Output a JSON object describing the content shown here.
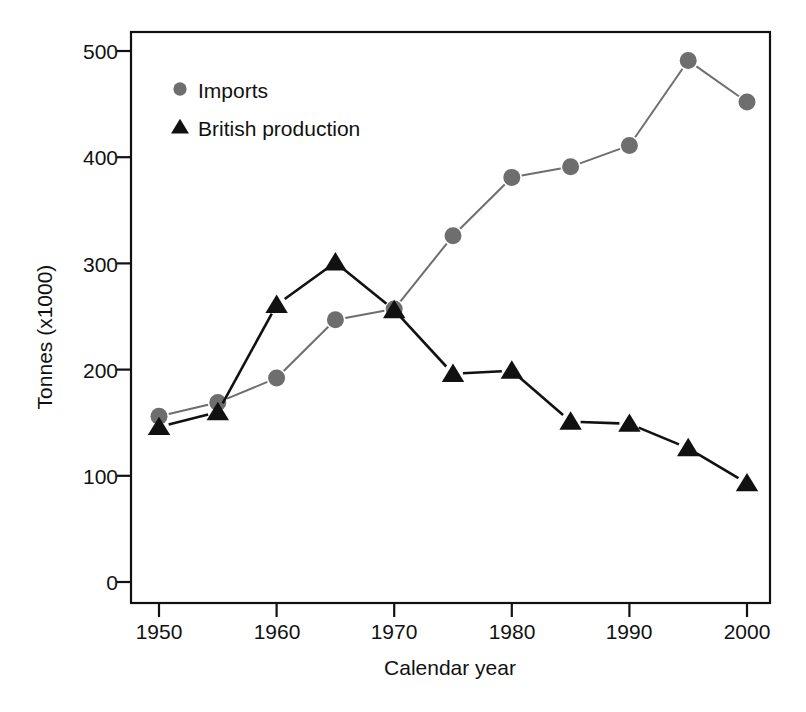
{
  "chart_data": {
    "type": "line",
    "title": "",
    "xlabel": "Calendar year",
    "ylabel": "Tonnes (x1000)",
    "x": [
      1950,
      1955,
      1960,
      1965,
      1970,
      1975,
      1980,
      1985,
      1990,
      1995,
      2000
    ],
    "xlim": [
      1946,
      2004
    ],
    "ylim": [
      -18,
      520
    ],
    "xticks": [
      1950,
      1960,
      1970,
      1980,
      1990,
      2000
    ],
    "xtick_labels": [
      "1950",
      "1960",
      "1970",
      "1980",
      "1990",
      "2000"
    ],
    "yticks": [
      0,
      100,
      200,
      300,
      400,
      500
    ],
    "ytick_labels": [
      "0",
      "100",
      "200",
      "300",
      "400",
      "500"
    ],
    "grid": false,
    "legend_position": "upper left",
    "series": [
      {
        "name": "Imports",
        "marker": "circle",
        "color": "#6e6e6e",
        "values": [
          156,
          169,
          192,
          247,
          257,
          326,
          381,
          391,
          411,
          491,
          452
        ]
      },
      {
        "name": "British production",
        "marker": "triangle",
        "color": "#111111",
        "values": [
          146,
          160,
          261,
          301,
          256,
          196,
          199,
          151,
          149,
          126,
          93
        ]
      }
    ]
  },
  "legend": {
    "items": [
      {
        "label": "Imports",
        "marker": "circle",
        "color": "#6e6e6e"
      },
      {
        "label": "British production",
        "marker": "triangle",
        "color": "#111111"
      }
    ]
  },
  "axes": {
    "x_title": "Calendar year",
    "y_title": "Tonnes (x1000)",
    "x_tick_labels": [
      "1950",
      "1960",
      "1970",
      "1980",
      "1990",
      "2000"
    ],
    "y_tick_labels": [
      "0",
      "100",
      "200",
      "300",
      "400",
      "500"
    ]
  },
  "style": {
    "frame_color": "#111111",
    "background": "#ffffff",
    "imports_color": "#6e6e6e",
    "production_color": "#111111"
  }
}
